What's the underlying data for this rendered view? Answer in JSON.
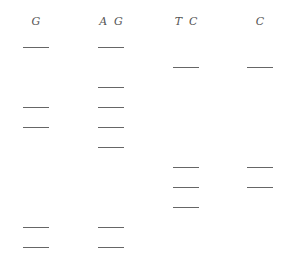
{
  "diagram": {
    "type": "sequencing-gel",
    "band_color": "#666666",
    "lanes": [
      {
        "label": "G",
        "x": 23,
        "bands": [
          47,
          107,
          127,
          227,
          247
        ]
      },
      {
        "label": "A  G",
        "x": 98,
        "bands": [
          47,
          87,
          107,
          127,
          147,
          227,
          247
        ]
      },
      {
        "label": "T  C",
        "x": 173,
        "bands": [
          67,
          167,
          187,
          207
        ]
      },
      {
        "label": "C",
        "x": 247,
        "bands": [
          67,
          167,
          187
        ]
      }
    ]
  }
}
